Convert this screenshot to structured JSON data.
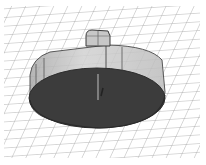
{
  "scene": {
    "description": "3D render of a cylindrical disc with a rectangular post on a perspective grid",
    "colors": {
      "background": "#ffffff",
      "grid": "#a8a8a8",
      "disc_bottom": "#3c3c3c",
      "disc_wall": "#b9b9b9",
      "post": "#c4c4c4",
      "edge": "#3a3a3a"
    }
  }
}
